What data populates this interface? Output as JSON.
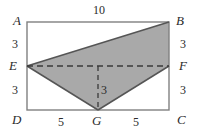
{
  "figure": {
    "colors": {
      "shade_fill": "#a9a9a9",
      "stroke": "#555555",
      "rect_stroke": "#808080",
      "text": "#2b2b2b",
      "background": "#ffffff"
    }
  },
  "vertices": {
    "A": "A",
    "B": "B",
    "C": "C",
    "D": "D",
    "E": "E",
    "F": "F",
    "G": "G"
  },
  "measures": {
    "top": "10",
    "left_upper": "3",
    "left_lower": "3",
    "right_upper": "3",
    "right_lower": "3",
    "bottom_left": "5",
    "bottom_right": "5",
    "altitude": "3"
  },
  "geometry": {
    "rect": {
      "x": 27,
      "y": 22,
      "width": 142,
      "height": 88
    },
    "points": {
      "A": [
        27,
        22
      ],
      "B": [
        169,
        22
      ],
      "C": [
        169,
        110
      ],
      "D": [
        27,
        110
      ],
      "E": [
        27,
        66
      ],
      "F": [
        169,
        66
      ],
      "G": [
        98,
        110
      ]
    },
    "shaded_polygon": [
      "E",
      "B",
      "F",
      "G"
    ],
    "dashed_segments": [
      [
        "E",
        "F"
      ],
      [
        "mid-EF",
        "G"
      ]
    ]
  }
}
